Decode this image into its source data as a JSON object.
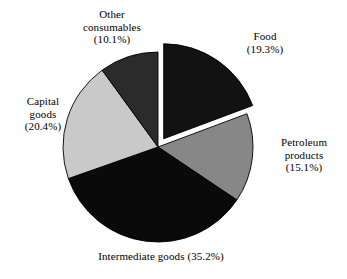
{
  "chart_data": {
    "type": "pie",
    "title": "",
    "subtitle": "",
    "xlabel": "",
    "ylabel": "",
    "legend_position": "none",
    "grid": false,
    "labels_inline": true,
    "start_angle_deg": 0,
    "direction": "clockwise",
    "categories": [
      "Food",
      "Petroleum products",
      "Intermediate goods",
      "Capital goods",
      "Other consumables"
    ],
    "values": [
      19.3,
      15.1,
      35.2,
      20.4,
      10.1
    ],
    "units": "%",
    "total": 100.1,
    "slices": [
      {
        "name": "Food",
        "value": 19.3,
        "label": "Food\n(19.3%)",
        "label_name": "Food",
        "label_value": "(19.3%)",
        "color": "#121212",
        "exploded": true,
        "start_deg": 0.0,
        "end_deg": 69.5
      },
      {
        "name": "Petroleum products",
        "value": 15.1,
        "label": "Petroleum\nproducts\n(15.1%)",
        "label_name": "Petroleum products",
        "label_value": "(15.1%)",
        "color": "#878787",
        "exploded": false,
        "start_deg": 69.5,
        "end_deg": 123.9
      },
      {
        "name": "Intermediate goods",
        "value": 35.2,
        "label": "Intermediate goods (35.2%)",
        "label_name": "Intermediate goods",
        "label_value": "(35.2%)",
        "color": "#0a0a0a",
        "exploded": false,
        "start_deg": 123.9,
        "end_deg": 250.6
      },
      {
        "name": "Capital goods",
        "value": 20.4,
        "label": "Capital\ngoods\n(20.4%)",
        "label_name": "Capital goods",
        "label_value": "(20.4%)",
        "color": "#c9c9c9",
        "exploded": false,
        "start_deg": 250.6,
        "end_deg": 324.0
      },
      {
        "name": "Other consumables",
        "value": 10.1,
        "label": "Other\nconsumables\n(10.1%)",
        "label_name": "Other consumables",
        "label_value": "(10.1%)",
        "color": "#2b2b2b",
        "exploded": false,
        "start_deg": 324.0,
        "end_deg": 360.0
      }
    ],
    "colors": {
      "food": "#121212",
      "petroleum_products": "#878787",
      "intermediate_goods": "#0a0a0a",
      "capital_goods": "#c9c9c9",
      "other_consumables": "#2b2b2b",
      "background": "#ffffff",
      "outline": "#000000",
      "text": "#000000"
    }
  },
  "labels": {
    "food": "Food\n(19.3%)",
    "petroleum": "Petroleum\nproducts\n(15.1%)",
    "intermediate": "Intermediate goods (35.2%)",
    "capital": "Capital\ngoods\n(20.4%)",
    "other": "Other\nconsumables\n(10.1%)"
  }
}
